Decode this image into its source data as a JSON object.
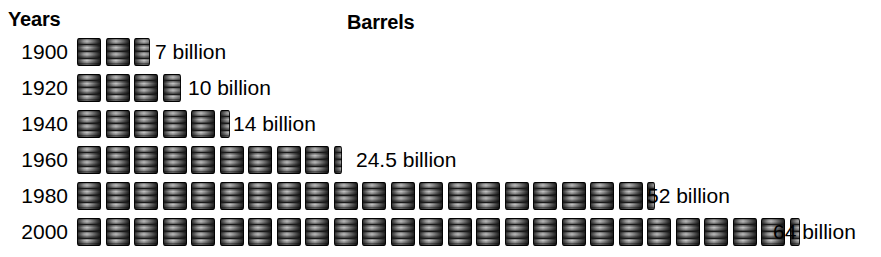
{
  "headers": {
    "years": "Years",
    "barrels": "Barrels"
  },
  "colors": {
    "background": "#ffffff",
    "text": "#000000",
    "barrel_dark": "#1f1f1f",
    "barrel_light": "#efefef"
  },
  "chart_data": {
    "type": "bar",
    "title": "",
    "subtitle": "",
    "xlabel": "Barrels",
    "ylabel": "Years",
    "grid": false,
    "legend": null,
    "unit": "billion barrels",
    "icon": "oil-barrel",
    "icon_value": 2.5,
    "categories": [
      "1900",
      "1920",
      "1940",
      "1960",
      "1980",
      "2000"
    ],
    "values": [
      7,
      10,
      14,
      24.5,
      52,
      64
    ],
    "value_labels": [
      "7 billion",
      "10 billion",
      "14 billion",
      "24.5 billion",
      "52 billion",
      "64 billion"
    ],
    "icon_counts": [
      2.8,
      4.0,
      5.6,
      9.8,
      20.8,
      25.6
    ],
    "xlim": [
      0,
      64
    ],
    "orientation": "horizontal"
  },
  "rows": [
    {
      "year": "1900",
      "value_label": "7 billion",
      "full_barrels": 2,
      "partial": "p66",
      "label_left": 155
    },
    {
      "year": "1920",
      "value_label": "10 billion",
      "full_barrels": 3,
      "partial": "p75",
      "label_left": 188
    },
    {
      "year": "1940",
      "value_label": "14 billion",
      "full_barrels": 5,
      "partial": "p40",
      "label_left": 233
    },
    {
      "year": "1960",
      "value_label": "24.5 billion",
      "full_barrels": 9,
      "partial": "p33",
      "label_left": 356
    },
    {
      "year": "1980",
      "value_label": "52 billion",
      "full_barrels": 20,
      "partial": "p33",
      "label_left": 647
    },
    {
      "year": "2000",
      "value_label": "64 billion",
      "full_barrels": 25,
      "partial": "p40",
      "label_left": 773
    }
  ]
}
